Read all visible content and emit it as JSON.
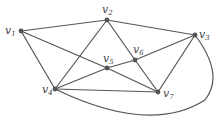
{
  "graph": {
    "nodes": [
      {
        "id": "v1",
        "label": "v",
        "sub": "1",
        "x": 21,
        "y": 31,
        "lx": 5,
        "ly": 34
      },
      {
        "id": "v2",
        "label": "v",
        "sub": "2",
        "x": 107,
        "y": 20,
        "lx": 102,
        "ly": 13
      },
      {
        "id": "v3",
        "label": "v",
        "sub": "3",
        "x": 195,
        "y": 35,
        "lx": 199,
        "ly": 38
      },
      {
        "id": "v4",
        "label": "v",
        "sub": "4",
        "x": 55,
        "y": 89,
        "lx": 42,
        "ly": 93
      },
      {
        "id": "v5",
        "label": "v",
        "sub": "5",
        "x": 107,
        "y": 68,
        "lx": 103,
        "ly": 62
      },
      {
        "id": "v6",
        "label": "v",
        "sub": "6",
        "x": 135,
        "y": 60,
        "lx": 133,
        "ly": 53
      },
      {
        "id": "v7",
        "label": "v",
        "sub": "7",
        "x": 158,
        "y": 92,
        "lx": 163,
        "ly": 97
      }
    ],
    "edges": [
      [
        "v1",
        "v2"
      ],
      [
        "v1",
        "v4"
      ],
      [
        "v1",
        "v5"
      ],
      [
        "v5",
        "v7"
      ],
      [
        "v2",
        "v3"
      ],
      [
        "v2",
        "v4"
      ],
      [
        "v2",
        "v6"
      ],
      [
        "v6",
        "v7"
      ],
      [
        "v4",
        "v5"
      ],
      [
        "v5",
        "v6"
      ],
      [
        "v6",
        "v3"
      ],
      [
        "v4",
        "v7"
      ],
      [
        "v3",
        "v7"
      ]
    ],
    "curved_edges": [
      {
        "from": "v4",
        "to": "v3",
        "path": "M55,89 Q150,135 205,100 Q225,75 195,35"
      }
    ]
  }
}
